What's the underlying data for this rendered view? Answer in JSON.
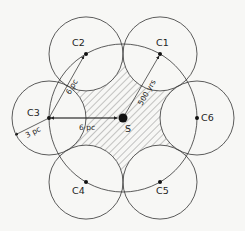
{
  "center": {
    "label": "S"
  },
  "clusters": [
    {
      "label": "C1",
      "angle_deg": -60
    },
    {
      "label": "C2",
      "angle_deg": -120
    },
    {
      "label": "C3",
      "angle_deg": 180
    },
    {
      "label": "C4",
      "angle_deg": 120
    },
    {
      "label": "C5",
      "angle_deg": 60
    },
    {
      "label": "C6",
      "angle_deg": 0
    }
  ],
  "annotations": {
    "s_to_c3": "6 pc",
    "c3_to_c2": "6 pc",
    "cluster_radius": "3 pc",
    "s_to_c1": "500 yrs"
  },
  "colors": {
    "stroke": "#333333",
    "background": "#f7f7f5"
  }
}
